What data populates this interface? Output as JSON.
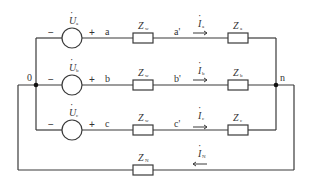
{
  "diagram": {
    "type": "three-phase four-wire circuit",
    "nodes": {
      "source_neutral": "0",
      "load_neutral": "n"
    },
    "sources": [
      {
        "symbol": "U",
        "sub": "a",
        "minus": "−",
        "plus": "+",
        "terminal": "a"
      },
      {
        "symbol": "U",
        "sub": "b",
        "minus": "−",
        "plus": "+",
        "terminal": "b"
      },
      {
        "symbol": "U",
        "sub": "c",
        "minus": "−",
        "plus": "+",
        "terminal": "c"
      }
    ],
    "line_impedances": [
      {
        "symbol": "Z",
        "sub": "w"
      },
      {
        "symbol": "Z",
        "sub": "w"
      },
      {
        "symbol": "Z",
        "sub": "w"
      }
    ],
    "load_terminals": [
      "a'",
      "b'",
      "c'"
    ],
    "currents": [
      {
        "symbol": "I",
        "sub": "a"
      },
      {
        "symbol": "I",
        "sub": "b"
      },
      {
        "symbol": "I",
        "sub": "c"
      }
    ],
    "load_impedances": [
      {
        "symbol": "Z",
        "sub": "a"
      },
      {
        "symbol": "Z",
        "sub": "b"
      },
      {
        "symbol": "Z",
        "sub": "c"
      }
    ],
    "neutral_impedance": {
      "symbol": "Z",
      "sub": "N"
    },
    "neutral_current": {
      "symbol": "I",
      "sub": "N"
    },
    "dot": "·",
    "colors": {
      "wire": "#3a3a3a",
      "node": "#111111",
      "text": "#333333",
      "background": "#ffffff"
    }
  }
}
